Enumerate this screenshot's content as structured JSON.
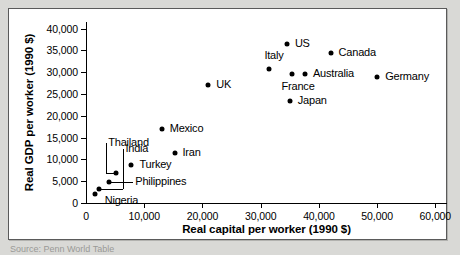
{
  "figure": {
    "caption_fragment": "Source: Penn World Table"
  },
  "chart_data": {
    "type": "scatter",
    "title": "",
    "xlabel": "Real capital per worker (1990 $)",
    "ylabel": "Real GDP per worker (1990 $)",
    "xlim": [
      0,
      62000
    ],
    "ylim": [
      0,
      41500
    ],
    "xticks": [
      0,
      10000,
      20000,
      30000,
      40000,
      50000,
      60000
    ],
    "xticklabels": [
      "0",
      "10,000",
      "20,000",
      "30,000",
      "40,000",
      "50,000",
      "60,000"
    ],
    "yticks": [
      0,
      5000,
      10000,
      15000,
      20000,
      25000,
      30000,
      35000,
      40000
    ],
    "yticklabels": [
      "0",
      "5,000",
      "10,000",
      "15,000",
      "20,000",
      "25,000",
      "30,000",
      "35,000",
      "40,000"
    ],
    "grid": false,
    "legend": "none",
    "marker_color": "#000000",
    "points": [
      {
        "name": "Nigeria",
        "x": 1500,
        "y": 2000,
        "label_dx": 10,
        "label_dy": 7,
        "leader": false
      },
      {
        "name": "India",
        "x": 2300,
        "y": 3100,
        "label_dx": 26,
        "label_dy": -40,
        "leader": true
      },
      {
        "name": "Philippines",
        "x": 4000,
        "y": 4800,
        "label_dx": 26,
        "label_dy": 0,
        "leader": true
      },
      {
        "name": "Thailand",
        "x": 5200,
        "y": 6800,
        "label_dx": -8,
        "label_dy": -30,
        "leader": true
      },
      {
        "name": "Turkey",
        "x": 7800,
        "y": 8700,
        "label_dx": 8,
        "label_dy": 0,
        "leader": false
      },
      {
        "name": "Mexico",
        "x": 13000,
        "y": 17000,
        "label_dx": 8,
        "label_dy": 0,
        "leader": false
      },
      {
        "name": "Iran",
        "x": 15200,
        "y": 11500,
        "label_dx": 8,
        "label_dy": 0,
        "leader": false
      },
      {
        "name": "UK",
        "x": 21000,
        "y": 27000,
        "label_dx": 8,
        "label_dy": 0,
        "leader": false
      },
      {
        "name": "Italy",
        "x": 31500,
        "y": 30800,
        "label_dx": -5,
        "label_dy": -13,
        "leader": false
      },
      {
        "name": "US",
        "x": 34500,
        "y": 36500,
        "label_dx": 8,
        "label_dy": 0,
        "leader": false
      },
      {
        "name": "Japan",
        "x": 35000,
        "y": 23500,
        "label_dx": 8,
        "label_dy": 0,
        "leader": false
      },
      {
        "name": "France",
        "x": 35300,
        "y": 29600,
        "label_dx": -10,
        "label_dy": 13,
        "leader": false
      },
      {
        "name": "Australia",
        "x": 37600,
        "y": 29600,
        "label_dx": 8,
        "label_dy": 0,
        "leader": false
      },
      {
        "name": "Canada",
        "x": 42000,
        "y": 34500,
        "label_dx": 8,
        "label_dy": 0,
        "leader": false
      },
      {
        "name": "Germany",
        "x": 50000,
        "y": 29000,
        "label_dx": 8,
        "label_dy": 0,
        "leader": false
      }
    ]
  }
}
